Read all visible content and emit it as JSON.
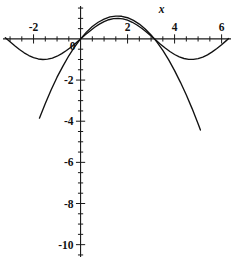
{
  "figure": {
    "title": "",
    "axis_label_x": "x",
    "axis_label_y": ""
  },
  "chart_data": {
    "type": "line",
    "title": "",
    "xlabel": "x",
    "ylabel": "",
    "xlim": [
      -3.3,
      6.4
    ],
    "ylim": [
      -10.6,
      1.6
    ],
    "grid": false,
    "legend": "none",
    "x_ticks_labeled": [
      -2,
      2,
      4,
      6
    ],
    "x_tick_labels": [
      "-2",
      "2",
      "4",
      "6"
    ],
    "x_minor_tick_step": 0.5,
    "y_ticks_labeled": [
      -2,
      -4,
      -6,
      -8,
      -10
    ],
    "y_tick_labels": [
      "-2",
      "-4",
      "-6",
      "-8",
      "-10"
    ],
    "y_minor_tick_step": 0.5,
    "origin_label": "0",
    "series": [
      {
        "name": "sine",
        "expression": "y = sin(x)",
        "color": "#111111",
        "x": [
          -3.2,
          -3.0,
          -2.8,
          -2.6,
          -2.4,
          -2.2,
          -2.0,
          -1.8,
          -1.6,
          -1.4,
          -1.2,
          -1.0,
          -0.8,
          -0.6,
          -0.4,
          -0.2,
          0.0,
          0.2,
          0.4,
          0.6,
          0.8,
          1.0,
          1.2,
          1.4,
          1.6,
          1.8,
          2.0,
          2.2,
          2.4,
          2.6,
          2.8,
          3.0,
          3.2,
          3.4,
          3.6,
          3.8,
          4.0,
          4.2,
          4.4,
          4.6,
          4.8,
          5.0,
          5.2,
          5.4,
          5.6,
          5.8,
          6.0,
          6.2,
          6.3
        ],
        "y": [
          0.058,
          -0.141,
          -0.335,
          -0.516,
          -0.675,
          -0.808,
          -0.909,
          -0.974,
          -1.0,
          -0.985,
          -0.932,
          -0.841,
          -0.717,
          -0.565,
          -0.389,
          -0.199,
          0.0,
          0.199,
          0.389,
          0.565,
          0.717,
          0.841,
          0.932,
          0.985,
          1.0,
          0.974,
          0.909,
          0.808,
          0.675,
          0.516,
          0.335,
          0.141,
          -0.058,
          -0.256,
          -0.443,
          -0.612,
          -0.757,
          -0.872,
          -0.952,
          -0.994,
          -0.996,
          -0.959,
          -0.883,
          -0.773,
          -0.631,
          -0.465,
          -0.279,
          -0.083,
          0.017
        ]
      },
      {
        "name": "parabola",
        "expression": "y = x(pi - x) * 0.45",
        "color": "#111111",
        "x": [
          -1.75,
          -1.5,
          -1.25,
          -1.0,
          -0.75,
          -0.5,
          -0.25,
          0.0,
          0.25,
          0.5,
          0.75,
          1.0,
          1.25,
          1.5,
          1.571,
          1.75,
          2.0,
          2.25,
          2.5,
          2.75,
          3.0,
          3.142,
          3.25,
          3.5,
          3.75,
          4.0,
          4.25,
          4.5,
          4.75,
          5.0,
          5.1
        ],
        "y": [
          -3.85,
          -3.14,
          -2.47,
          -1.86,
          -1.32,
          -0.82,
          -0.38,
          0.0,
          0.33,
          0.6,
          0.81,
          0.96,
          1.07,
          1.11,
          1.11,
          1.1,
          1.03,
          0.9,
          0.72,
          0.48,
          0.19,
          0.0,
          -0.16,
          -0.56,
          -1.02,
          -1.54,
          -2.11,
          -2.73,
          -3.4,
          -4.12,
          -4.43
        ]
      }
    ]
  }
}
